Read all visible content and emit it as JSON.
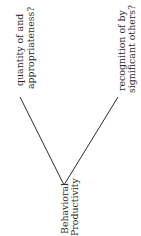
{
  "diagram": {
    "root": {
      "line1": "Behavioral",
      "line2": "Productivity"
    },
    "branches": [
      {
        "line1": "quantity of and",
        "line2": "appropriateness?"
      },
      {
        "line1": "recognition of by",
        "line2": "significant others?"
      }
    ],
    "orientation": "rotated-90-ccw",
    "line_color": "#2a2a2a"
  }
}
